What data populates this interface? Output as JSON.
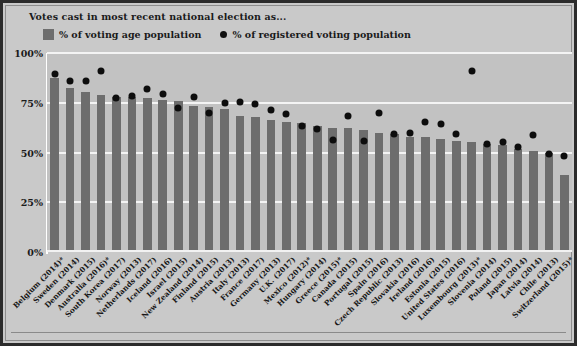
{
  "chart": {
    "title": "Votes cast in most recent national election as...",
    "legend": [
      {
        "marker": "square-swatch",
        "label": "% of voting age population",
        "color": "#6e6e6e"
      },
      {
        "marker": "circle-dot",
        "label": "% of registered voting population",
        "color": "#111111"
      }
    ],
    "y_tick_labels": [
      "100%",
      "75%",
      "50%",
      "25%",
      "0%"
    ]
  },
  "chart_data": {
    "type": "bar",
    "title": "Votes cast in most recent national election as...",
    "xlabel": "",
    "ylabel": "",
    "ylim": [
      0,
      100
    ],
    "yticks": [
      0,
      25,
      50,
      75,
      100
    ],
    "grid": true,
    "legend_position": "top",
    "categories": [
      "Belgium (2014)*",
      "Sweden (2014)",
      "Denmark (2015)",
      "Australia (2016)*",
      "South Korea (2017)",
      "Norway (2013)",
      "Netherlands (2017)",
      "Iceland (2016)",
      "Israel (2015)",
      "New Zealand (2014)",
      "Finland (2015)",
      "Austria (2013)",
      "Italy (2013)",
      "France (2017)",
      "Germany (2013)",
      "U.K. (2017)",
      "Mexico (2012)*",
      "Hungary (2014)",
      "Greece (2015)*",
      "Canada (2015)",
      "Portugal (2015)",
      "Spain (2016)",
      "Czech Republic (2013)",
      "Slovakia (2016)",
      "Ireland (2016)",
      "Estonia (2015)",
      "United States (2016)",
      "Luxembourg (2013)*",
      "Slovenia (2014)",
      "Poland (2015)",
      "Japan (2014)",
      "Latvia (2014)",
      "Chile (2013)",
      "Switzerland (2015)*"
    ],
    "series": [
      {
        "name": "% of voting age population",
        "type": "bar",
        "color": "#6d6d6d",
        "values": [
          87.2,
          82.6,
          80.3,
          79.0,
          77.9,
          77.9,
          77.3,
          76.4,
          76.1,
          73.2,
          73.1,
          72.0,
          68.5,
          67.9,
          66.1,
          65.4,
          64.8,
          63.3,
          62.1,
          62.1,
          61.1,
          60.0,
          59.3,
          58.0,
          58.0,
          56.8,
          55.7,
          55.1,
          54.1,
          53.8,
          52.0,
          51.0,
          49.8,
          38.6
        ]
      },
      {
        "name": "% of registered voting population",
        "type": "scatter",
        "color": "#0d0d0d",
        "values": [
          89.4,
          85.8,
          85.9,
          91.0,
          77.2,
          78.3,
          81.9,
          79.2,
          72.3,
          77.9,
          70.1,
          74.9,
          75.2,
          74.6,
          71.5,
          69.3,
          63.1,
          61.7,
          56.2,
          68.3,
          55.8,
          69.8,
          59.5,
          59.8,
          65.1,
          64.2,
          59.4,
          91.1,
          54.1,
          55.3,
          52.7,
          58.9,
          49.4,
          48.4
        ]
      }
    ]
  }
}
